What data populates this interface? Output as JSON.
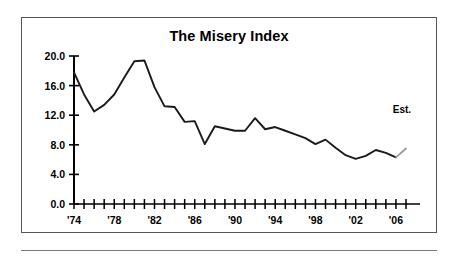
{
  "figure": {
    "title": "The Misery Index",
    "annotation": "Est.",
    "axis_color": "#000000",
    "line_color": "#1a1a1a",
    "estimate_line_color": "#9a9a9a",
    "border_color": "#555555",
    "background": "#ffffff"
  },
  "chart_data": {
    "type": "line",
    "title": "The Misery Index",
    "xlabel": "",
    "ylabel": "",
    "ylim": [
      0.0,
      20.0
    ],
    "xlim": [
      1974,
      2007
    ],
    "grid": false,
    "legend": null,
    "ytick_labels": [
      "0.0",
      "4.0",
      "8.0",
      "12.0",
      "16.0",
      "20.0"
    ],
    "ytick_values": [
      0.0,
      4.0,
      8.0,
      12.0,
      16.0,
      20.0
    ],
    "xtick_labels": [
      "'74",
      "'78",
      "'82",
      "'86",
      "'90",
      "'94",
      "'98",
      "'02",
      "'06"
    ],
    "xtick_values": [
      1974,
      1978,
      1982,
      1986,
      1990,
      1994,
      1998,
      2002,
      2006
    ],
    "x": [
      1974,
      1975,
      1976,
      1977,
      1978,
      1979,
      1980,
      1981,
      1982,
      1983,
      1984,
      1985,
      1986,
      1987,
      1988,
      1989,
      1990,
      1991,
      1992,
      1993,
      1994,
      1995,
      1996,
      1997,
      1998,
      1999,
      2000,
      2001,
      2002,
      2003,
      2004,
      2005,
      2006,
      2007
    ],
    "values": [
      17.8,
      14.8,
      12.5,
      13.4,
      14.8,
      17.1,
      19.3,
      19.4,
      15.8,
      13.2,
      13.1,
      11.1,
      11.2,
      8.1,
      10.5,
      10.2,
      9.9,
      9.9,
      11.6,
      10.1,
      10.4,
      9.9,
      9.4,
      8.9,
      8.1,
      8.7,
      7.6,
      6.6,
      6.1,
      6.5,
      7.3,
      6.9,
      6.3,
      7.5
    ],
    "series": [
      {
        "name": "Misery Index",
        "values": [
          17.8,
          14.8,
          12.5,
          13.4,
          14.8,
          17.1,
          19.3,
          19.4,
          15.8,
          13.2,
          13.1,
          11.1,
          11.2,
          8.1,
          10.5,
          10.2,
          9.9,
          9.9,
          11.6,
          10.1,
          10.4,
          9.9,
          9.4,
          8.9,
          8.1,
          8.7,
          7.6,
          6.6,
          6.1,
          6.5,
          7.3,
          6.9,
          6.3,
          7.5
        ]
      }
    ],
    "annotations": [
      {
        "text": "Est.",
        "x": 2006.6,
        "y": 12.3,
        "note": "final segment drawn as estimate"
      }
    ],
    "estimate_from_index": 32
  }
}
